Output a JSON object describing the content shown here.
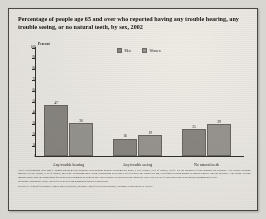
{
  "chart_data": {
    "type": "bar",
    "title": "Percentage of people age 65 and over who reported having any trouble hearing, any trouble seeing, or no natural teeth, by sex, 2002",
    "xlabel": "",
    "ylabel": "Percent",
    "ylim": [
      0,
      100
    ],
    "ytick_step": 10,
    "yticks": [
      "100",
      "90",
      "80",
      "70",
      "60",
      "50",
      "40",
      "30",
      "20",
      "10",
      "0"
    ],
    "grid": false,
    "legend_position": "top-center",
    "categories": [
      "Any trouble hearing",
      "Any trouble seeing",
      "No natural teeth"
    ],
    "series": [
      {
        "name": "Men",
        "color": "#8b8883",
        "values": [
          47,
          16,
          25
        ]
      },
      {
        "name": "Women",
        "color": "#9a9792",
        "values": [
          30,
          19,
          29
        ]
      }
    ]
  },
  "notes": {
    "note": "NOTE: Respondents were asked \"Which statement best describes your hearing without a hearing aid: good, a little trouble, a lot of trouble, deaf?\" For the purposes of this indicator the category \"Any trouble hearing\" includes \"a little trouble, a lot of trouble, and deaf.\" Regarding their vision, respondents were asked \"Do you have any trouble seeing, even when wearing glasses or contact lenses?\" and the category \"Any trouble seeing\" includes those who in a subsequent question report blindness or blind in only one person's eyes and/or in one question. Have you lost all of your upper and lower natural (permanent) teeth?\"",
    "reference": "Reference population: These data refer to the civilian noninstitutionalized population.",
    "source": "SOURCE: Centers for Disease Control and Prevention, National Center for Health Statistics, National Health Interview Survey."
  }
}
